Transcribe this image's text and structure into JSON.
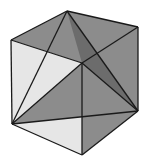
{
  "diagram": {
    "vertices": {
      "top_back": [
        67,
        11
      ],
      "left_top": [
        11,
        40
      ],
      "right_top": [
        138,
        27
      ],
      "front_top": [
        82,
        63
      ],
      "left_bottom": [
        12,
        124
      ],
      "front_bottom": [
        82,
        155
      ],
      "right_bottom": [
        138,
        111
      ]
    },
    "colors": {
      "light_face": "#e6e6e6",
      "gray_face": "#8c8c8c",
      "dark_face": "#6c6c6c",
      "stroke": "#1a1a1a"
    }
  }
}
